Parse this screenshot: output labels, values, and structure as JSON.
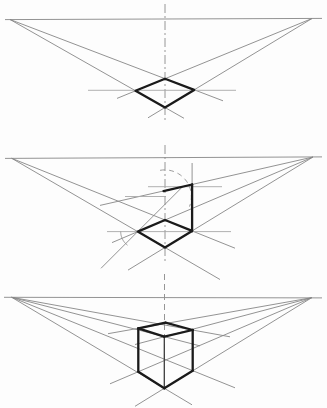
{
  "canvas": {
    "width": 327,
    "height": 408,
    "background": "#fdfdfd"
  },
  "style": {
    "thin_color": "#878787",
    "light_color": "#a8a8a8",
    "thick_color": "#1a1a1a",
    "dash_color": "#8a8a8a",
    "thin_width": 0.9,
    "thick_width": 2.3
  },
  "panels": [
    {
      "name": "step-1-perspective-base-square",
      "horizon": [
        5,
        19.6,
        322,
        18.4
      ],
      "centerline": {
        "x": 165,
        "y1": 4,
        "y2": 122,
        "pattern": "dashdot"
      },
      "vanishing_points": [
        [
          10,
          19.5
        ],
        [
          312,
          18.5
        ]
      ],
      "thin": [
        [
          10,
          19.5,
          223,
          100.8
        ],
        [
          10,
          19.5,
          184,
          118.3
        ],
        [
          312,
          18.5,
          117,
          98.4
        ],
        [
          312,
          18.5,
          148,
          117.8
        ]
      ],
      "light": [
        [
          88,
          90.3,
          236,
          90.3
        ]
      ],
      "arcs": [],
      "thick_polygon": [
        [
          165,
          78.7
        ],
        [
          194.2,
          89.9
        ],
        [
          165,
          107.5
        ],
        [
          135.5,
          90.7
        ]
      ],
      "thick": [],
      "medium": []
    },
    {
      "name": "step-2-height-construction",
      "horizon": [
        5,
        158.4,
        322,
        156.9
      ],
      "centerline": {
        "x": 165,
        "y1": 145,
        "y2": 263,
        "pattern": "dashdot"
      },
      "vanishing_points": [
        [
          11.7,
          158.3
        ],
        [
          313,
          157
        ]
      ],
      "thin": [
        [
          11.7,
          158.3,
          235,
          248.2
        ],
        [
          11.7,
          158.3,
          220,
          279.5
        ],
        [
          313,
          157,
          112,
          242.6
        ],
        [
          313,
          157,
          128,
          270.1
        ],
        [
          313,
          157,
          100,
          205.4
        ],
        [
          192.1,
          163,
          192.1,
          233
        ],
        [
          101,
          268.3,
          182.5,
          186.8
        ]
      ],
      "light": [
        [
          148,
          186.7,
          222,
          186.7
        ],
        [
          125,
          196.5,
          166,
          196.5
        ],
        [
          107,
          231.6,
          231,
          231.6
        ]
      ],
      "arcs": [
        {
          "cx": 164.7,
          "cy": 196.6,
          "r": 26.7,
          "a0": 100,
          "a1": -22,
          "dashed": true
        },
        {
          "cx": 137.7,
          "cy": 231.6,
          "r": 17,
          "a0": 180,
          "a1": 233,
          "dashed": false
        }
      ],
      "thick_polygon": [
        [
          165,
          220
        ],
        [
          192.1,
          230.9
        ],
        [
          165,
          247.5
        ],
        [
          137.7,
          231.6
        ]
      ],
      "thick": [
        [
          192.1,
          230.9,
          192.1,
          184.5
        ],
        [
          163.5,
          191.1,
          192.1,
          184.5
        ]
      ],
      "medium": []
    },
    {
      "name": "step-3-completed-cube",
      "horizon": [
        4,
        297.3,
        322,
        297.9
      ],
      "centerline": {
        "x": 164.5,
        "y1": 274,
        "y2": 360,
        "pattern": "dash"
      },
      "vanishing_points": [
        [
          11.7,
          297.3
        ],
        [
          311.7,
          297.7
        ]
      ],
      "thin": [
        [
          11.7,
          297.3,
          200,
          345.9
        ],
        [
          11.7,
          297.3,
          230,
          336.8
        ],
        [
          11.7,
          297.3,
          192,
          404.8
        ],
        [
          11.7,
          297.3,
          235,
          387.8
        ],
        [
          311.7,
          297.7,
          135,
          344.5
        ],
        [
          311.7,
          297.7,
          108,
          333.7
        ],
        [
          311.7,
          297.7,
          135,
          406.3
        ],
        [
          311.7,
          297.7,
          110,
          383.8
        ]
      ],
      "light": [],
      "arcs": [],
      "thick_polygon": null,
      "thick": [
        [
          165.5,
          322.7,
          138.3,
          328.3
        ],
        [
          165.5,
          322.7,
          192.7,
          330
        ],
        [
          138.3,
          328.3,
          164.3,
          336.7
        ],
        [
          192.7,
          330,
          164.3,
          336.7
        ],
        [
          138.3,
          328.3,
          138.3,
          371.7
        ],
        [
          192.7,
          330,
          192.7,
          370.7
        ],
        [
          138.3,
          371.7,
          164.3,
          388.3
        ],
        [
          192.7,
          370.7,
          164.3,
          388.3
        ]
      ],
      "medium": [
        [
          164.3,
          336.7,
          164.3,
          388.3
        ]
      ]
    }
  ]
}
